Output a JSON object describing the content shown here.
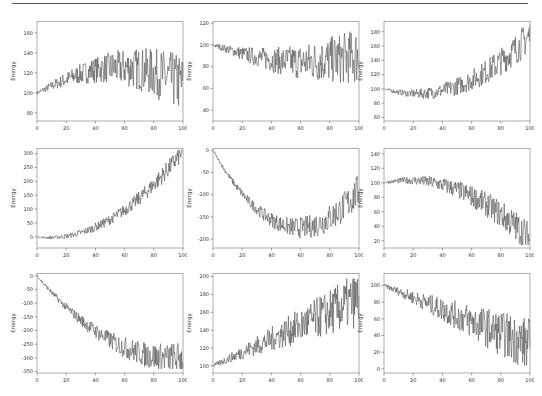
{
  "figure": {
    "rows": 3,
    "cols": 3,
    "line_color": "#555555",
    "frame_color": "#999999"
  },
  "chart_data": [
    {
      "type": "line",
      "title": "",
      "xlabel": "",
      "ylabel": "Energy",
      "xlim": [
        0,
        100
      ],
      "ylim": [
        72,
        172
      ],
      "xticks": [
        0,
        20,
        40,
        60,
        80,
        100
      ],
      "yticks": [
        80,
        100,
        120,
        140,
        160
      ],
      "trend": "rise-then-slight-fall",
      "start": 100,
      "end": 105,
      "noise_growth": "high",
      "min": 72,
      "max": 170
    },
    {
      "type": "line",
      "title": "",
      "xlabel": "",
      "ylabel": "Energy",
      "xlim": [
        0,
        100
      ],
      "ylim": [
        30,
        122
      ],
      "xticks": [
        0,
        20,
        40,
        60,
        80,
        100
      ],
      "yticks": [
        40,
        60,
        80,
        100,
        120
      ],
      "trend": "slight-decline",
      "start": 100,
      "end": 90,
      "noise_growth": "high",
      "min": 33,
      "max": 119
    },
    {
      "type": "line",
      "title": "",
      "xlabel": "",
      "ylabel": "Energy",
      "xlim": [
        0,
        100
      ],
      "ylim": [
        55,
        195
      ],
      "xticks": [
        0,
        20,
        40,
        60,
        80,
        100
      ],
      "yticks": [
        60,
        80,
        100,
        120,
        140,
        160,
        180
      ],
      "trend": "dip-then-rise",
      "start": 100,
      "end": 175,
      "noise_growth": "medium",
      "min": 60,
      "max": 190
    },
    {
      "type": "line",
      "title": "",
      "xlabel": "",
      "ylabel": "Energy",
      "xlim": [
        0,
        100
      ],
      "ylim": [
        -40,
        320
      ],
      "xticks": [
        0,
        20,
        40,
        60,
        80,
        100
      ],
      "yticks": [
        0,
        50,
        100,
        150,
        200,
        250,
        300
      ],
      "trend": "quadratic-rise",
      "start": 0,
      "end": 310,
      "noise_growth": "low",
      "min": -20,
      "max": 312
    },
    {
      "type": "line",
      "title": "",
      "xlabel": "",
      "ylabel": "Energy",
      "xlim": [
        0,
        100
      ],
      "ylim": [
        -220,
        5
      ],
      "xticks": [
        0,
        20,
        40,
        60,
        80,
        100
      ],
      "yticks": [
        0,
        -50,
        -100,
        -150,
        -200
      ],
      "trend": "quadratic-dip",
      "start": 0,
      "end": -90,
      "noise_growth": "medium",
      "min": -210,
      "max": 0
    },
    {
      "type": "line",
      "title": "",
      "xlabel": "",
      "ylabel": "Energy",
      "xlim": [
        0,
        100
      ],
      "ylim": [
        10,
        148
      ],
      "xticks": [
        0,
        20,
        40,
        60,
        80,
        100
      ],
      "yticks": [
        20,
        40,
        60,
        80,
        100,
        120,
        140
      ],
      "trend": "rise-then-quadratic-fall",
      "start": 100,
      "end": 22,
      "noise_growth": "medium",
      "min": 14,
      "max": 144
    },
    {
      "type": "line",
      "title": "",
      "xlabel": "",
      "ylabel": "Energy",
      "xlim": [
        0,
        100
      ],
      "ylim": [
        -355,
        10
      ],
      "xticks": [
        0,
        20,
        40,
        60,
        80,
        100
      ],
      "yticks": [
        0,
        -50,
        -100,
        -150,
        -200,
        -250,
        -300,
        -350
      ],
      "trend": "decline-then-plateau",
      "start": 0,
      "end": -290,
      "noise_growth": "medium",
      "min": -340,
      "max": 0
    },
    {
      "type": "line",
      "title": "",
      "xlabel": "",
      "ylabel": "Energy",
      "xlim": [
        0,
        100
      ],
      "ylim": [
        92,
        204
      ],
      "xticks": [
        0,
        20,
        40,
        60,
        80,
        100
      ],
      "yticks": [
        100,
        120,
        140,
        160,
        180,
        200
      ],
      "trend": "steady-rise",
      "start": 100,
      "end": 175,
      "noise_growth": "high",
      "min": 96,
      "max": 200
    },
    {
      "type": "line",
      "title": "",
      "xlabel": "",
      "ylabel": "Energy",
      "xlim": [
        0,
        100
      ],
      "ylim": [
        -5,
        115
      ],
      "xticks": [
        0,
        20,
        40,
        60,
        80,
        100
      ],
      "yticks": [
        0,
        20,
        40,
        60,
        80,
        100
      ],
      "trend": "steady-decline",
      "start": 100,
      "end": 28,
      "noise_growth": "high",
      "min": 2,
      "max": 110
    }
  ],
  "panels": [
    {
      "left": 37,
      "top": 21,
      "w": 146,
      "h": 100
    },
    {
      "left": 213,
      "top": 21,
      "w": 146,
      "h": 100
    },
    {
      "left": 384,
      "top": 21,
      "w": 146,
      "h": 100
    },
    {
      "left": 37,
      "top": 148,
      "w": 146,
      "h": 100
    },
    {
      "left": 213,
      "top": 148,
      "w": 146,
      "h": 100
    },
    {
      "left": 384,
      "top": 148,
      "w": 146,
      "h": 100
    },
    {
      "left": 37,
      "top": 273,
      "w": 146,
      "h": 100
    },
    {
      "left": 213,
      "top": 273,
      "w": 146,
      "h": 100
    },
    {
      "left": 384,
      "top": 273,
      "w": 146,
      "h": 100
    }
  ]
}
